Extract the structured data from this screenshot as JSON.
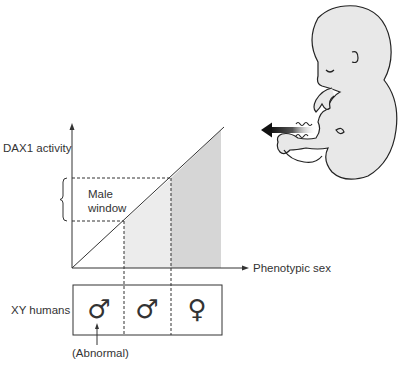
{
  "diagram": {
    "y_axis_label": "DAX1 activity",
    "x_axis_label": "Phenotypic sex",
    "window_label_line1": "Male",
    "window_label_line2": "window",
    "row_label": "XY humans",
    "annotation": "(Abnormal)",
    "phenotypes": [
      {
        "symbol": "♂",
        "meaning": "male"
      },
      {
        "symbol": "♂",
        "meaning": "male"
      },
      {
        "symbol": "♀",
        "meaning": "female"
      }
    ],
    "colors": {
      "line": "#333333",
      "light_shade": "#ececec",
      "dark_shade": "#d6d6d6",
      "fetus_fill": "#e8e8e8",
      "fetus_outline": "#222222"
    }
  }
}
